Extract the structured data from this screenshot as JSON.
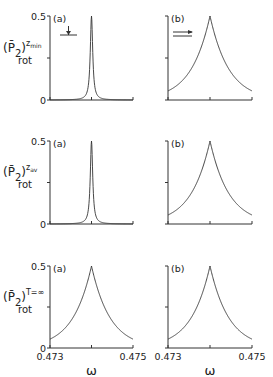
{
  "chart_data": [
    {
      "type": "line",
      "panel": "(a)",
      "row": 1,
      "ylabel": "(P̄2)rot^(z_min)",
      "ylabel_main": "(P̄",
      "ylabel_sub": "2",
      "ylabel_close": ")",
      "ylabel_sup": "z",
      "ylabel_sup_sub": "min",
      "ylabel_rot": "rot",
      "xlabel": "",
      "xlim": [
        0.473,
        0.475
      ],
      "ylim": [
        0,
        0.5
      ],
      "yticks": [
        0,
        0.25,
        0.5
      ],
      "ytick_labels": [
        "0",
        "",
        "0.5"
      ],
      "xticks": [
        0.473,
        0.474,
        0.475
      ],
      "xtick_labels": [
        "",
        "",
        ""
      ],
      "peak_x": 0.474,
      "peak_y": 0.5,
      "shape": "lorentzian",
      "half_width": 3.5e-05,
      "annotation": "down-arrow onto horizontal bar",
      "series": [
        {
          "name": "(a)",
          "x": [
            0.473,
            0.4735,
            0.4738,
            0.4739,
            0.47395,
            0.474,
            0.47405,
            0.4741,
            0.4742,
            0.4745,
            0.475
          ],
          "y": [
            0.0,
            0.001,
            0.003,
            0.01,
            0.1,
            0.5,
            0.1,
            0.01,
            0.003,
            0.001,
            0.0
          ]
        }
      ]
    },
    {
      "type": "line",
      "panel": "(b)",
      "row": 1,
      "xlim": [
        0.473,
        0.475
      ],
      "ylim": [
        0,
        0.5
      ],
      "yticks": [
        0,
        0.25,
        0.5
      ],
      "xticks": [
        0.473,
        0.474,
        0.475
      ],
      "peak_x": 0.474,
      "peak_y": 0.5,
      "shape": "cusp",
      "decay": 0.00045,
      "annotation": "double right arrow",
      "series": [
        {
          "name": "(b)",
          "x": [
            0.473,
            0.4735,
            0.474,
            0.4745,
            0.475
          ],
          "y": [
            0.055,
            0.15,
            0.5,
            0.15,
            0.055
          ]
        }
      ]
    },
    {
      "type": "line",
      "panel": "(a)",
      "row": 2,
      "ylabel": "(P̄2)rot^(z_av)",
      "ylabel_main": "(P̄",
      "ylabel_sub": "2",
      "ylabel_close": ")",
      "ylabel_sup": "z",
      "ylabel_sup_sub": "av",
      "ylabel_rot": "rot",
      "xlim": [
        0.473,
        0.475
      ],
      "ylim": [
        0,
        0.5
      ],
      "yticks": [
        0,
        0.25,
        0.5
      ],
      "ytick_labels": [
        "0",
        "",
        "0.5"
      ],
      "xticks": [
        0.473,
        0.474,
        0.475
      ],
      "peak_x": 0.474,
      "peak_y": 0.5,
      "shape": "lorentzian",
      "half_width": 3.5e-05,
      "series": [
        {
          "name": "(a)",
          "x": [
            0.473,
            0.4738,
            0.4739,
            0.47395,
            0.474,
            0.47405,
            0.4741,
            0.4742,
            0.475
          ],
          "y": [
            0.0,
            0.003,
            0.01,
            0.1,
            0.5,
            0.1,
            0.01,
            0.003,
            0.0
          ]
        }
      ]
    },
    {
      "type": "line",
      "panel": "(b)",
      "row": 2,
      "xlim": [
        0.473,
        0.475
      ],
      "ylim": [
        0,
        0.5
      ],
      "yticks": [
        0,
        0.25,
        0.5
      ],
      "xticks": [
        0.473,
        0.474,
        0.475
      ],
      "peak_x": 0.474,
      "peak_y": 0.5,
      "shape": "cusp",
      "decay": 0.00045,
      "series": [
        {
          "name": "(b)",
          "x": [
            0.473,
            0.4735,
            0.474,
            0.4745,
            0.475
          ],
          "y": [
            0.055,
            0.15,
            0.5,
            0.15,
            0.055
          ]
        }
      ]
    },
    {
      "type": "line",
      "panel": "(a)",
      "row": 3,
      "ylabel": "(P̄2)rot^(T=∞)",
      "ylabel_main": "(P̄",
      "ylabel_sub": "2",
      "ylabel_close": ")",
      "ylabel_sup": "T=∞",
      "ylabel_sup_sub": "",
      "ylabel_rot": "rot",
      "xlabel": "ω",
      "xlim": [
        0.473,
        0.475
      ],
      "ylim": [
        0,
        0.5
      ],
      "yticks": [
        0,
        0.25,
        0.5
      ],
      "ytick_labels": [
        "0",
        "",
        "0.5"
      ],
      "xticks": [
        0.473,
        0.474,
        0.475
      ],
      "xtick_labels": [
        "0.473",
        "",
        "0.475"
      ],
      "peak_x": 0.474,
      "peak_y": 0.5,
      "shape": "cusp",
      "decay": 0.00045,
      "series": [
        {
          "name": "(a)",
          "x": [
            0.473,
            0.4735,
            0.474,
            0.4745,
            0.475
          ],
          "y": [
            0.055,
            0.15,
            0.5,
            0.15,
            0.055
          ]
        }
      ]
    },
    {
      "type": "line",
      "panel": "(b)",
      "row": 3,
      "xlabel": "ω",
      "xlim": [
        0.473,
        0.475
      ],
      "ylim": [
        0,
        0.5
      ],
      "yticks": [
        0,
        0.25,
        0.5
      ],
      "xticks": [
        0.473,
        0.474,
        0.475
      ],
      "xtick_labels": [
        "0.473",
        "",
        "0.475"
      ],
      "peak_x": 0.474,
      "peak_y": 0.5,
      "shape": "cusp",
      "decay": 0.00045,
      "series": [
        {
          "name": "(b)",
          "x": [
            0.473,
            0.4735,
            0.474,
            0.4745,
            0.475
          ],
          "y": [
            0.055,
            0.15,
            0.5,
            0.15,
            0.055
          ]
        }
      ]
    }
  ],
  "layout": {
    "columns": [
      {
        "x0": 50,
        "x1": 133
      },
      {
        "x0": 168,
        "x1": 252
      }
    ],
    "rows": [
      {
        "ytop": 16,
        "y0": 100
      },
      {
        "ytop": 141,
        "y0": 224
      },
      {
        "ytop": 266,
        "y0": 348
      }
    ]
  }
}
